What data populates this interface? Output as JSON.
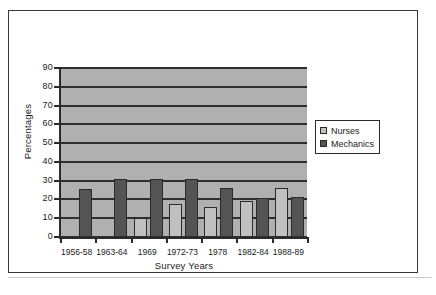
{
  "chart_data": {
    "type": "bar",
    "title": "",
    "xlabel": "Survey Years",
    "ylabel": "Percentages",
    "categories": [
      "1956-58",
      "1963-64",
      "1969",
      "1972-73",
      "1978",
      "1982-84",
      "1988-89"
    ],
    "series": [
      {
        "name": "Nurses",
        "color": "#c0c0c0",
        "values": [
          0,
          0,
          10,
          17.5,
          16,
          19,
          26
        ]
      },
      {
        "name": "Mechanics",
        "color": "#545454",
        "values": [
          25.5,
          31,
          31,
          31,
          26,
          21,
          21.5
        ]
      }
    ],
    "ylim": [
      0,
      90
    ],
    "yticks": [
      0,
      10,
      20,
      30,
      40,
      50,
      60,
      70,
      80,
      90
    ],
    "grid": true,
    "legend_position": "right",
    "plot_background": "#b0b0b0"
  },
  "legend": {
    "entries": [
      {
        "label": "Nurses"
      },
      {
        "label": "Mechanics"
      }
    ]
  },
  "axes": {
    "x_title": "Survey Years",
    "y_title": "Percentages"
  }
}
